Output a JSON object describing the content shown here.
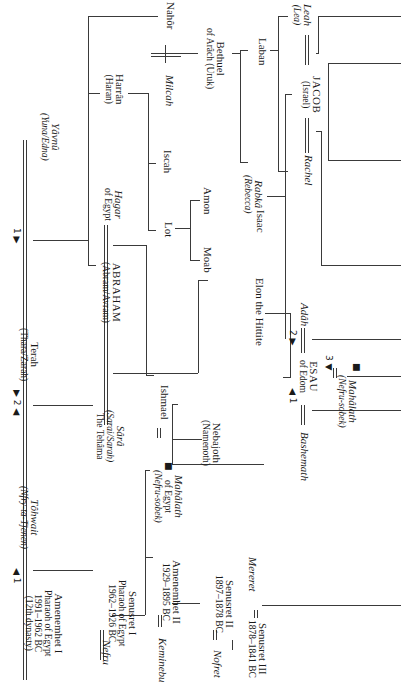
{
  "diagram": {
    "orientation": "rotated 90 degrees clockwise",
    "people": {
      "nahor": {
        "name": "Nahôr"
      },
      "harran": {
        "name": "Harrân",
        "alt": "(Haran)"
      },
      "milcah": {
        "name": "Milcah"
      },
      "bethuel": {
        "name": "Bethuel",
        "alt": "of Arâch (Uruk)"
      },
      "laban": {
        "name": "Laban"
      },
      "leah": {
        "name": "Leah",
        "alt": "(Lea)"
      },
      "jacob": {
        "name": "JACOB",
        "alt": "(Israel)"
      },
      "rachel": {
        "name": "Rachel"
      },
      "yavnu": {
        "name": "Yâvnû",
        "alt": "(Yuna/Edna)"
      },
      "iscah": {
        "name": "Iscah"
      },
      "rabka": {
        "name": "Rabkâ",
        "alt": "(Rebecca)"
      },
      "isaac": {
        "name": "Isaac"
      },
      "hagar": {
        "name": "Hagar",
        "alt": "of Egypt"
      },
      "lot": {
        "name": "Lot"
      },
      "amon": {
        "name": "Amon"
      },
      "moab": {
        "name": "Moab"
      },
      "terah": {
        "name": "Terah",
        "alt": "(Thara/Zarah)"
      },
      "abraham": {
        "name": "ABRAHAM",
        "alt": "(Abram/Avram)"
      },
      "elon": {
        "name": "Elon the Hittite"
      },
      "adah": {
        "name": "Adâh"
      },
      "esau": {
        "name": "ESAU",
        "alt": "of Edom"
      },
      "mahalath_esau": {
        "name": "Mahâlath",
        "alt": "(Nefru-sobek)"
      },
      "sara": {
        "name": "Sârâ",
        "alt": "(Sarai/Sarah)",
        "alt2": "The Tehâma"
      },
      "ishmael": {
        "name": "Ishmael"
      },
      "nebajoth": {
        "name": "Nebajoth",
        "alt": "(Namenoth)"
      },
      "bashemath": {
        "name": "Bashemath"
      },
      "tohwait": {
        "name": "Tôhwait",
        "alt": "(Nfry-ta-Tjenen)"
      },
      "amenemhet1": {
        "name": "Amenemhet I",
        "l2": "Pharaoh of Egypt",
        "l3": "1991–1962 BC",
        "l4": "(12th dynasty)"
      },
      "nefru": {
        "name": "Nefru"
      },
      "senusret1": {
        "name": "Senusret I",
        "l2": "Pharaoh of Egypt",
        "l3": "1962–1926 BC"
      },
      "mahalath_ishmael": {
        "name": "Mahâlath",
        "l2": "of Egypt",
        "l3": "(Nefru-sobek)"
      },
      "keminebu": {
        "name": "Keminebu"
      },
      "amenemhet2": {
        "name": "Amenemhet II",
        "l2": "1929–1895 BC"
      },
      "nofret": {
        "name": "Nofret"
      },
      "senusret2": {
        "name": "Senusret II",
        "l2": "1897–1878 BC"
      },
      "senusret3": {
        "name": "Senusret III",
        "l2": "1878–1841 BC"
      },
      "mereret": {
        "name": "Mereret"
      }
    },
    "marriage_markers": {
      "terah_1": "1 ▶",
      "terah_2": "▶ 2 ◀",
      "amenemhet_1": "◀ 1",
      "esau_1": "◀ 1",
      "esau_2": "2 ▶",
      "esau_3": "3 ▼",
      "square_marker": "■"
    },
    "colors": {
      "line": "#3a3a3a",
      "text": "#1a1a1a",
      "background": "#ffffff"
    }
  }
}
